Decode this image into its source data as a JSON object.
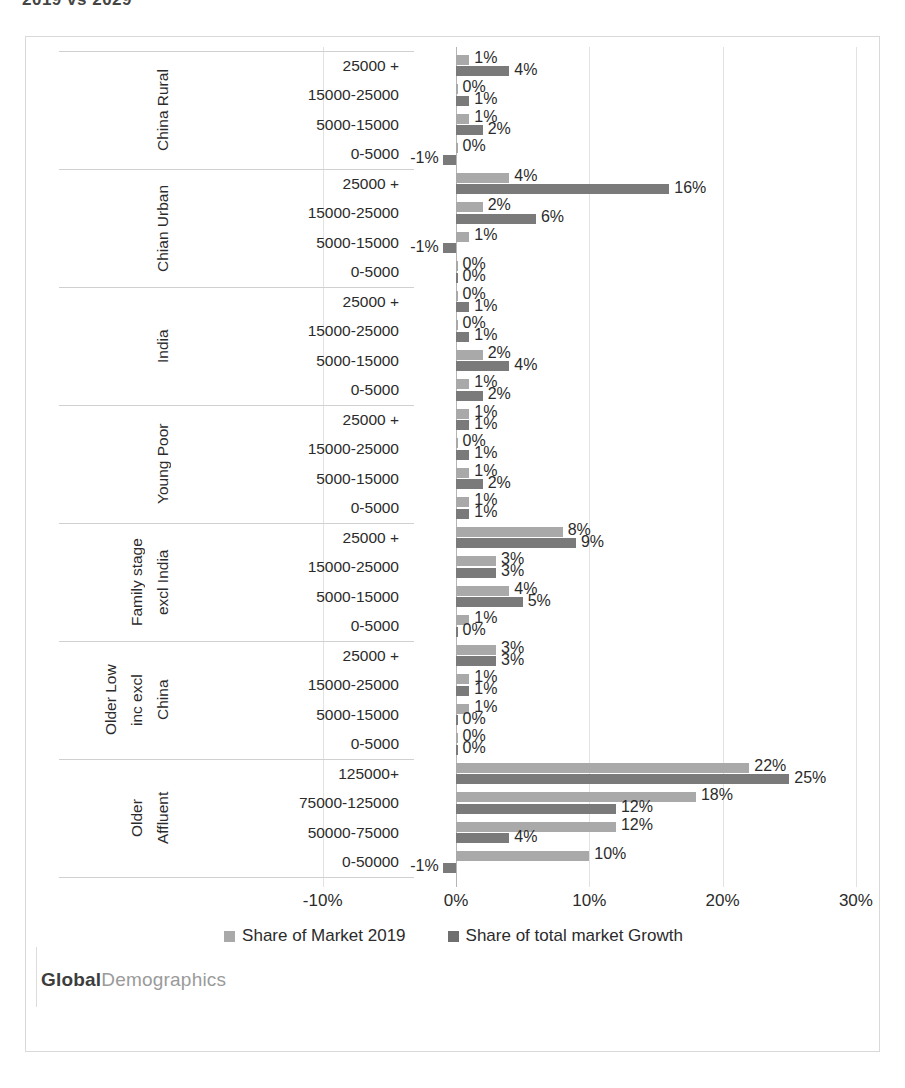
{
  "title_remnant": "2019 vs 2029",
  "brand": {
    "bold": "Global",
    "light": "Demographics"
  },
  "legend": {
    "position": "bottom",
    "items": [
      {
        "label": "Share of Market 2019",
        "color": "#a9a9a9"
      },
      {
        "label": "Share of total market Growth",
        "color": "#6f6f6f"
      }
    ]
  },
  "axis": {
    "ticks": [
      "-10%",
      "0%",
      "10%",
      "20%",
      "30%"
    ],
    "min": -10,
    "max": 30,
    "step": 10
  },
  "chart_data": {
    "type": "bar",
    "orientation": "horizontal",
    "title": "",
    "xlabel": "",
    "ylabel": "",
    "xlim": [
      -10,
      30
    ],
    "grid": true,
    "legend_position": "bottom",
    "series_names": [
      "Share of Market 2019",
      "Share of total market Growth"
    ],
    "series_colors": [
      "#a9a9a9",
      "#6f6f6f"
    ],
    "groups": [
      {
        "name": "China Rural",
        "name_lines": [
          "China Rural"
        ],
        "rows": [
          {
            "band": "25000 +",
            "v1": 1,
            "v2": 4,
            "l1": "1%",
            "l2": "4%"
          },
          {
            "band": "15000-25000",
            "v1": 0,
            "v2": 1,
            "l1": "0%",
            "l2": "1%"
          },
          {
            "band": "5000-15000",
            "v1": 1,
            "v2": 2,
            "l1": "1%",
            "l2": "2%"
          },
          {
            "band": "0-5000",
            "v1": 0,
            "v2": -1,
            "l1": "0%",
            "l2": "-1%"
          }
        ]
      },
      {
        "name": "Chian Urban",
        "name_lines": [
          "Chian Urban"
        ],
        "rows": [
          {
            "band": "25000 +",
            "v1": 4,
            "v2": 16,
            "l1": "4%",
            "l2": "16%"
          },
          {
            "band": "15000-25000",
            "v1": 2,
            "v2": 6,
            "l1": "2%",
            "l2": "6%"
          },
          {
            "band": "5000-15000",
            "v1": 1,
            "v2": -1,
            "l1": "1%",
            "l2": "-1%"
          },
          {
            "band": "0-5000",
            "v1": 0,
            "v2": 0,
            "l1": "0%",
            "l2": "0%"
          }
        ]
      },
      {
        "name": "India",
        "name_lines": [
          "India"
        ],
        "rows": [
          {
            "band": "25000 +",
            "v1": 0,
            "v2": 1,
            "l1": "0%",
            "l2": "1%"
          },
          {
            "band": "15000-25000",
            "v1": 0,
            "v2": 1,
            "l1": "0%",
            "l2": "1%"
          },
          {
            "band": "5000-15000",
            "v1": 2,
            "v2": 4,
            "l1": "2%",
            "l2": "4%"
          },
          {
            "band": "0-5000",
            "v1": 1,
            "v2": 2,
            "l1": "1%",
            "l2": "2%"
          }
        ]
      },
      {
        "name": "Young Poor",
        "name_lines": [
          "Young Poor"
        ],
        "rows": [
          {
            "band": "25000 +",
            "v1": 1,
            "v2": 1,
            "l1": "1%",
            "l2": "1%"
          },
          {
            "band": "15000-25000",
            "v1": 0,
            "v2": 1,
            "l1": "0%",
            "l2": "1%"
          },
          {
            "band": "5000-15000",
            "v1": 1,
            "v2": 2,
            "l1": "1%",
            "l2": "2%"
          },
          {
            "band": "0-5000",
            "v1": 1,
            "v2": 1,
            "l1": "1%",
            "l2": "1%"
          }
        ]
      },
      {
        "name": "Family stage excl India",
        "name_lines": [
          "Family stage",
          "excl India"
        ],
        "rows": [
          {
            "band": "25000 +",
            "v1": 8,
            "v2": 9,
            "l1": "8%",
            "l2": "9%"
          },
          {
            "band": "15000-25000",
            "v1": 3,
            "v2": 3,
            "l1": "3%",
            "l2": "3%"
          },
          {
            "band": "5000-15000",
            "v1": 4,
            "v2": 5,
            "l1": "4%",
            "l2": "5%"
          },
          {
            "band": "0-5000",
            "v1": 1,
            "v2": 0,
            "l1": "1%",
            "l2": "0%"
          }
        ]
      },
      {
        "name": "Older Low inc excl China",
        "name_lines": [
          "Older Low",
          "inc excl",
          "China"
        ],
        "rows": [
          {
            "band": "25000 +",
            "v1": 3,
            "v2": 3,
            "l1": "3%",
            "l2": "3%"
          },
          {
            "band": "15000-25000",
            "v1": 1,
            "v2": 1,
            "l1": "1%",
            "l2": "1%"
          },
          {
            "band": "5000-15000",
            "v1": 1,
            "v2": 0,
            "l1": "1%",
            "l2": "0%"
          },
          {
            "band": "0-5000",
            "v1": 0,
            "v2": 0,
            "l1": "0%",
            "l2": "0%"
          }
        ]
      },
      {
        "name": "Older Affluent",
        "name_lines": [
          "Older",
          "Affluent"
        ],
        "rows": [
          {
            "band": "125000+",
            "v1": 22,
            "v2": 25,
            "l1": "22%",
            "l2": "25%"
          },
          {
            "band": "75000-125000",
            "v1": 18,
            "v2": 12,
            "l1": "18%",
            "l2": "12%"
          },
          {
            "band": "50000-75000",
            "v1": 12,
            "v2": 4,
            "l1": "12%",
            "l2": "4%"
          },
          {
            "band": "0-50000",
            "v1": 10,
            "v2": -1,
            "l1": "10%",
            "l2": "-1%"
          }
        ]
      }
    ]
  }
}
